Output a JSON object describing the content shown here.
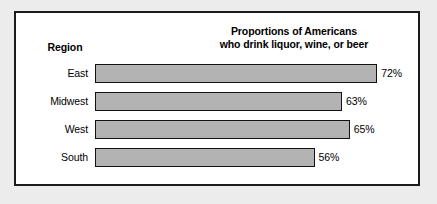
{
  "frame": {
    "border_color": "#1b1b1b",
    "background_color": "#ffffff",
    "page_background_color": "#ececec"
  },
  "header": {
    "region_column_label": "Region"
  },
  "title": {
    "line1": "Proportions of Americans",
    "line2": "who drink liquor, wine, or beer"
  },
  "chart_data": {
    "type": "bar",
    "orientation": "horizontal",
    "title": "Proportions of Americans who drink liquor, wine, or beer",
    "xlabel": "",
    "ylabel": "Region",
    "categories": [
      "East",
      "Midwest",
      "West",
      "South"
    ],
    "values": [
      72,
      63,
      65,
      56
    ],
    "value_labels": [
      "72%",
      "63%",
      "65%",
      "56%"
    ],
    "units": "percent",
    "xlim": [
      0,
      100
    ],
    "grid": false,
    "legend": false,
    "bar_fill_color": "#b3b3b3",
    "bar_border_color": "#111111",
    "bars": [
      {
        "label": "East",
        "value": 72,
        "display": "72%"
      },
      {
        "label": "Midwest",
        "value": 63,
        "display": "63%"
      },
      {
        "label": "West",
        "value": 65,
        "display": "65%"
      },
      {
        "label": "South",
        "value": 56,
        "display": "56%"
      }
    ]
  },
  "layout": {
    "bar_origin_x": 0,
    "px_per_percent": 3.92,
    "row_height": 19,
    "row_gap": 9,
    "rows_top": 51
  }
}
